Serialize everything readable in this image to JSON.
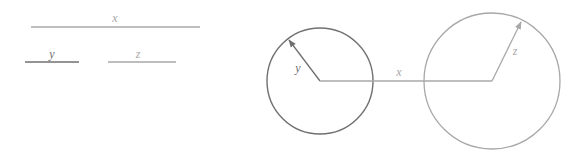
{
  "legend": {
    "x": {
      "label": "x",
      "color": "#a8a8a8"
    },
    "y": {
      "label": "y",
      "color": "#707070"
    },
    "z": {
      "label": "z",
      "color": "#a8a8a8"
    }
  },
  "figure": {
    "circle_y": {
      "label": "y",
      "color": "#707070"
    },
    "segment_x": {
      "label": "x",
      "color": "#a8a8a8"
    },
    "circle_z": {
      "label": "z",
      "color": "#a8a8a8"
    }
  }
}
